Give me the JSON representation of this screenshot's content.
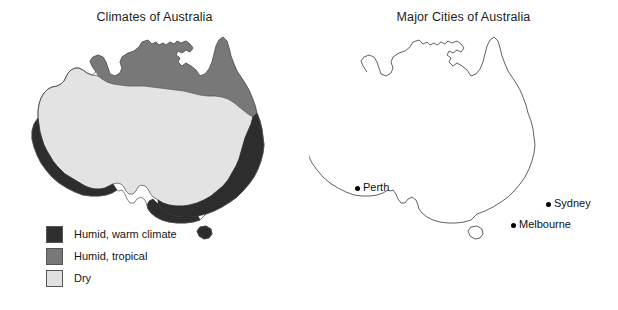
{
  "figure": {
    "background_color": "#ffffff",
    "panels": [
      {
        "id": "climates",
        "title": "Climates of Australia"
      },
      {
        "id": "cities",
        "title": "Major Cities of Australia"
      }
    ]
  },
  "climate_map": {
    "title": "Climates of Australia",
    "outline_color": "#4a4a4a",
    "legend": [
      {
        "label": "Humid, warm climate",
        "color": "#2f2f2f",
        "swatch_name": "humid-warm-swatch"
      },
      {
        "label": "Humid, tropical",
        "color": "#787878",
        "swatch_name": "humid-tropical-swatch"
      },
      {
        "label": "Dry",
        "color": "#e0e0e0",
        "swatch_name": "dry-swatch"
      }
    ]
  },
  "cities_map": {
    "title": "Major Cities of Australia",
    "outline_color": "#3a3a3a",
    "dot_color": "#000000",
    "cities": [
      {
        "name": "Perth",
        "dot_x": 48,
        "dot_y": 188,
        "label_x": 55,
        "label_y": 183
      },
      {
        "name": "Sydney",
        "dot_x": 239,
        "dot_y": 204,
        "label_x": 246,
        "label_y": 199
      },
      {
        "name": "Melbourne",
        "dot_x": 204,
        "dot_y": 225,
        "label_x": 211,
        "label_y": 220
      }
    ]
  }
}
